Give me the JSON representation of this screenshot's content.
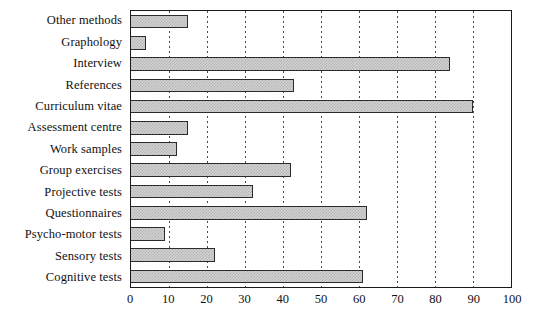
{
  "chart_data": {
    "type": "bar",
    "orientation": "horizontal",
    "title": "",
    "subtitle": "",
    "xlabel": "",
    "ylabel": "",
    "xlim": [
      0,
      100
    ],
    "xticks": [
      0,
      10,
      20,
      30,
      40,
      50,
      60,
      70,
      80,
      90,
      100
    ],
    "grid": "vertical-dotted",
    "legend": "none",
    "categories": [
      "Other methods",
      "Graphology",
      "Interview",
      "References",
      "Curriculum vitae",
      "Assessment centre",
      "Work samples",
      "Group exercises",
      "Projective tests",
      "Questionnaires",
      "Psycho-motor tests",
      "Sensory tests",
      "Cognitive tests"
    ],
    "values": [
      15,
      4,
      84,
      43,
      90,
      15,
      12,
      42,
      32,
      62,
      9,
      22,
      61
    ],
    "bar_fill": "#d2d2d2",
    "bar_pattern": "#b4b4b4",
    "bar_border": "#2b2b2b",
    "axis_color": "#1a1a1a",
    "gridline_color": "#4a4a4a",
    "text_color": "#111111"
  }
}
